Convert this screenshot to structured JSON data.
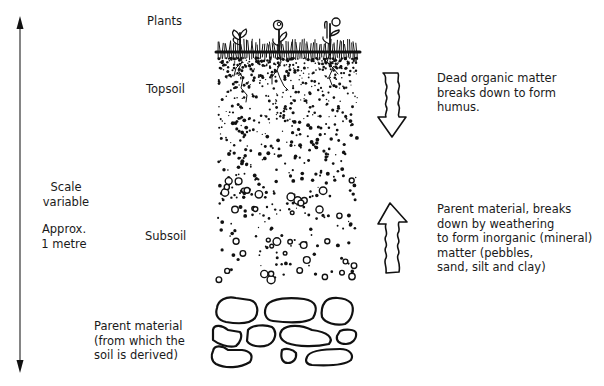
{
  "diagram": {
    "scale": {
      "line1": "Scale",
      "line2": "variable",
      "approx1": "Approx.",
      "approx2": "1 metre"
    },
    "layers": [
      {
        "id": "plants",
        "label": "Plants"
      },
      {
        "id": "topsoil",
        "label": "Topsoil"
      },
      {
        "id": "subsoil",
        "label": "Subsoil"
      },
      {
        "id": "parent",
        "label_lines": [
          "Parent material",
          "(from which the",
          "soil is derived)"
        ]
      }
    ],
    "processes": [
      {
        "direction": "down",
        "icon": "wavy-down-arrow-icon",
        "lines": [
          "Dead organic matter",
          "breaks down to form",
          "humus."
        ]
      },
      {
        "direction": "up",
        "icon": "wavy-up-arrow-icon",
        "lines": [
          "Parent material, breaks",
          "down by weathering",
          "to form inorganic (mineral)",
          "matter (pebbles,",
          "sand, silt and clay)"
        ]
      }
    ],
    "colors": {
      "ink": "#1a1a1a",
      "background": "#ffffff"
    }
  }
}
